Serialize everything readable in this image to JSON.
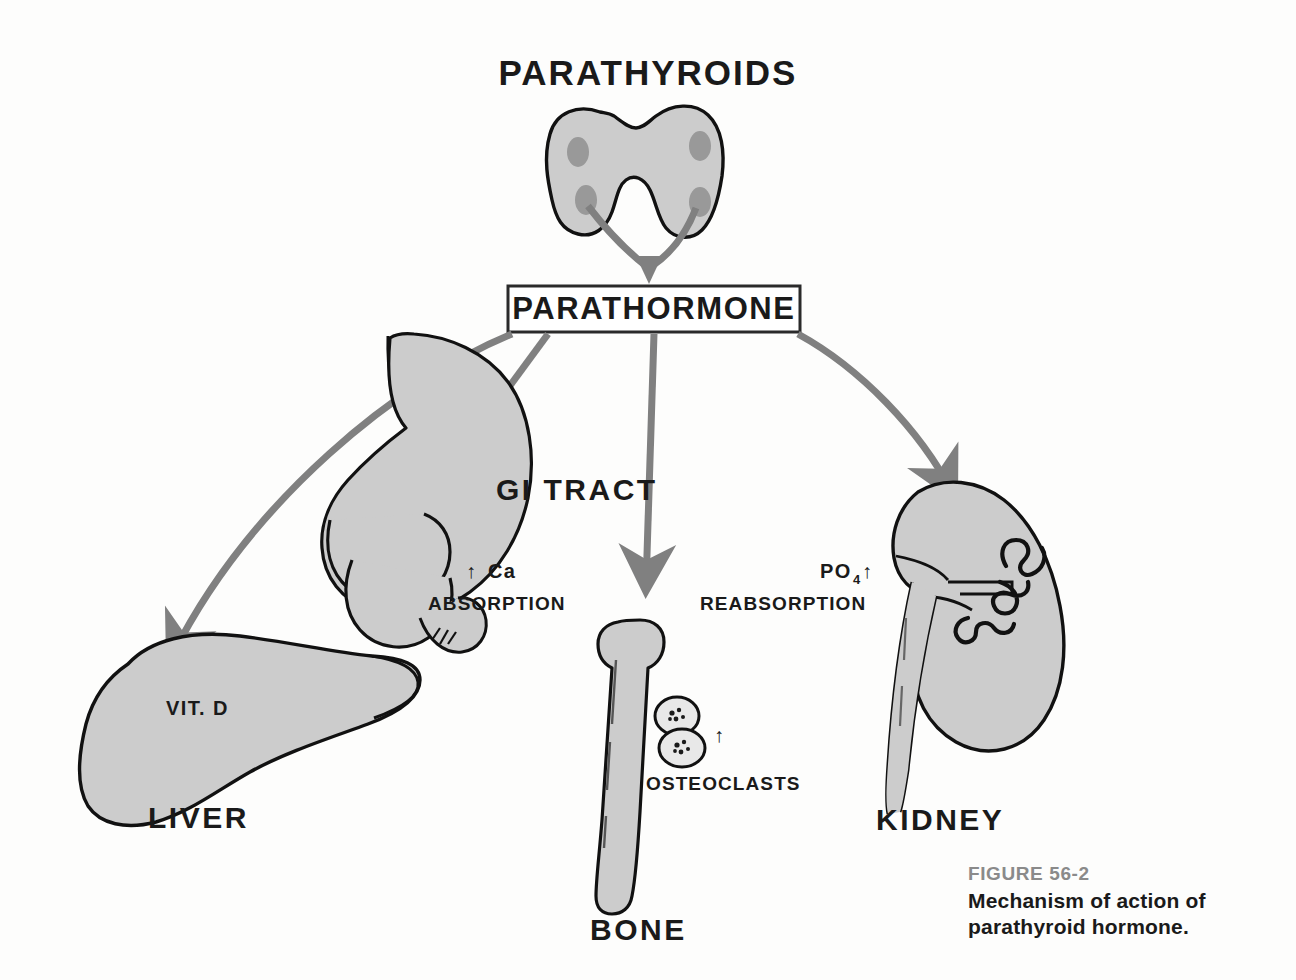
{
  "figure": {
    "title": "PARATHYROIDS",
    "hormone_box_label": "PARATHORMONE",
    "caption_number": "FIGURE 56-2",
    "caption_line1": "Mechanism of action of",
    "caption_line2": "parathyroid hormone."
  },
  "organs": {
    "liver": {
      "name": "LIVER",
      "inner_label": "VIT. D"
    },
    "gi_tract": {
      "name": "GI TRACT"
    },
    "bone": {
      "name": "BONE",
      "cell_label": "OSTEOCLASTS"
    },
    "kidney": {
      "name": "KIDNEY"
    }
  },
  "effects": {
    "ca_absorption": {
      "arrow": "↑",
      "analyte": "Ca",
      "action": "ABSORPTION"
    },
    "po4_reabsorption": {
      "analyte_base": "PO",
      "analyte_sub": "4",
      "arrow": "↑",
      "action": "REABSORPTION"
    },
    "osteoclast_activity": {
      "arrow": "↑"
    }
  },
  "colors": {
    "organ_fill": "#cccccc",
    "nodule_fill": "#999999",
    "outline": "#111111",
    "arrow_gray": "#808080",
    "caption_gray": "#8a8a8a",
    "background": "#fdfdfc"
  }
}
